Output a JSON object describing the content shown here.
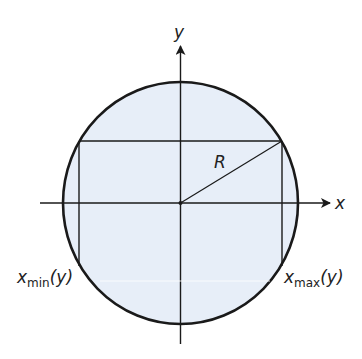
{
  "diagram": {
    "type": "circle-region-bounds",
    "colors": {
      "fill": "#e7eef8",
      "stroke": "#1a1a1a",
      "background": "#ffffff"
    },
    "axes": {
      "x_label": "x",
      "y_label": "y"
    },
    "radius_label": "R",
    "left_bound": {
      "var": "x",
      "sub": "min",
      "arg": "(y)"
    },
    "right_bound": {
      "var": "x",
      "sub": "max",
      "arg": "(y)"
    }
  }
}
